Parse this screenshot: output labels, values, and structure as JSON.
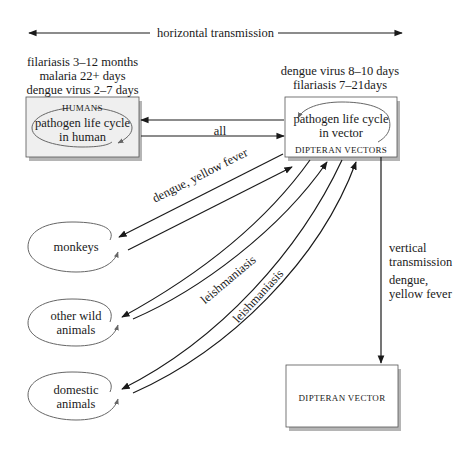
{
  "diagram": {
    "horizontal_label": "horizontal transmission",
    "human_durations": [
      "filariasis 3–12 months",
      "malaria 22+ days",
      "dengue virus 2–7 days"
    ],
    "vector_durations": [
      "dengue virus 8–10 days",
      "filariasis 7–21days"
    ],
    "humans_box": {
      "title": "HUMANS",
      "cycle_line1": "pathogen life cycle",
      "cycle_line2": "in human"
    },
    "vectors_box": {
      "title": "DIPTERAN VECTORS",
      "cycle_line1": "pathogen life cycle",
      "cycle_line2": "in vector"
    },
    "link_all": "all",
    "link_monkeys": "dengue, yellow fever",
    "link_wild": "leishmaniasis",
    "link_domestic": "leishmaniasis",
    "hosts": {
      "monkeys": [
        "monkeys"
      ],
      "wild": [
        "other wild",
        "animals"
      ],
      "domestic": [
        "domestic",
        "animals"
      ]
    },
    "vertical": {
      "label1": "vertical",
      "label2": "transmission",
      "label3": "dengue,",
      "label4": "yellow fever"
    },
    "bottom_box": {
      "title": "DIPTERAN VECTOR"
    },
    "colors": {
      "line": "#1a1a1a",
      "box_fill": "#efefef",
      "shadow": "#b5b5b5",
      "ellipse": "#666666"
    }
  }
}
